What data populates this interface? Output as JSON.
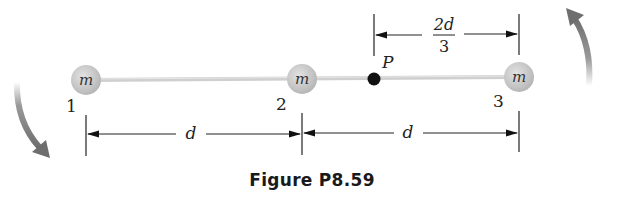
{
  "figure": {
    "caption": "Figure P8.59",
    "masses": [
      {
        "label": "m",
        "index": "1"
      },
      {
        "label": "m",
        "index": "2"
      },
      {
        "label": "m",
        "index": "3"
      }
    ],
    "point": {
      "label": "P"
    },
    "dimensions": {
      "lower_left": "d",
      "lower_right": "d",
      "upper_numerator": "2d",
      "upper_denominator": "3"
    },
    "rotation": {
      "direction": "clockwise"
    },
    "colors": {
      "mass_fill": "#c8c8c8",
      "rod": "#cfcfcf",
      "point": "#111111",
      "arrow": "#7a7a7a",
      "line": "#222222"
    }
  }
}
